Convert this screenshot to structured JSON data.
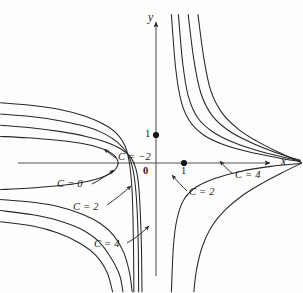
{
  "figure": {
    "background_color": "#fdfdfc",
    "ink_color": "#262626"
  },
  "axes": {
    "x_label": "x",
    "y_label": "y",
    "origin_label": "0",
    "x_tick_label": "1",
    "y_tick_label": "1",
    "x_axis_y_pixel": 163,
    "y_axis_x_pixel": 156,
    "unit_pixels": 28
  },
  "contour_labels": [
    {
      "id": "c-neg2",
      "text": "C = −2"
    },
    {
      "id": "c-0-left",
      "text": "C = 0"
    },
    {
      "id": "c-2-left",
      "text": "C = 2"
    },
    {
      "id": "c-4-left",
      "text": "C = 4"
    },
    {
      "id": "c-2-right",
      "text": "C = 2"
    },
    {
      "id": "c-4-right",
      "text": "C = 4"
    }
  ],
  "chart_data": {
    "type": "line",
    "xlabel": "x",
    "ylabel": "y",
    "grid": false,
    "legend": "inline-annotations",
    "xlim": [
      -5.6,
      5.2
    ],
    "ylim": [
      -4.6,
      5.4
    ],
    "marked_points": [
      {
        "x": 0,
        "y": 1,
        "label": "1",
        "style": "filled-dot"
      },
      {
        "x": 1,
        "y": 0,
        "label": "1",
        "style": "filled-dot"
      },
      {
        "x": 0,
        "y": 0,
        "label": "0",
        "style": "origin"
      }
    ],
    "levels": [
      -2,
      0,
      2,
      4
    ],
    "series": [
      {
        "name": "C = -2",
        "level": -2,
        "branches": [
          {
            "name": "left-loop-upper",
            "points": [
              [
                -5.55,
                0.95
              ],
              [
                -4.6,
                0.9
              ],
              [
                -3.6,
                0.82
              ],
              [
                -2.8,
                0.72
              ],
              [
                -2.2,
                0.6
              ],
              [
                -1.75,
                0.44
              ],
              [
                -1.5,
                0.28
              ],
              [
                -1.38,
                0.12
              ],
              [
                -1.35,
                0.0
              ]
            ]
          },
          {
            "name": "left-loop-lower",
            "points": [
              [
                -1.35,
                0.0
              ],
              [
                -1.38,
                -0.12
              ],
              [
                -1.5,
                -0.28
              ],
              [
                -1.75,
                -0.44
              ],
              [
                -2.2,
                -0.6
              ],
              [
                -2.8,
                -0.72
              ],
              [
                -3.6,
                -0.82
              ],
              [
                -4.6,
                -0.9
              ],
              [
                -5.55,
                -0.95
              ]
            ]
          },
          {
            "name": "right-upper",
            "points": [
              [
                0.55,
                5.3
              ],
              [
                0.7,
                3.4
              ],
              [
                0.9,
                2.2
              ],
              [
                1.2,
                1.5
              ],
              [
                1.7,
                1.0
              ],
              [
                2.4,
                0.66
              ],
              [
                3.3,
                0.4
              ],
              [
                4.3,
                0.2
              ],
              [
                5.15,
                0.05
              ]
            ]
          },
          {
            "name": "right-lower",
            "points": [
              [
                0.55,
                -4.6
              ],
              [
                0.62,
                -3.0
              ],
              [
                0.75,
                -2.0
              ],
              [
                1.0,
                -1.3
              ],
              [
                1.45,
                -0.85
              ],
              [
                2.1,
                -0.55
              ],
              [
                3.0,
                -0.3
              ],
              [
                4.1,
                -0.12
              ],
              [
                5.15,
                -0.02
              ]
            ]
          }
        ]
      },
      {
        "name": "C = 0",
        "level": 0,
        "branches": [
          {
            "name": "left-upper",
            "points": [
              [
                -5.55,
                1.35
              ],
              [
                -4.4,
                1.25
              ],
              [
                -3.4,
                1.12
              ],
              [
                -2.5,
                0.95
              ],
              [
                -1.8,
                0.75
              ],
              [
                -1.25,
                0.5
              ],
              [
                -0.9,
                0.2
              ],
              [
                -0.72,
                -0.2
              ],
              [
                -0.62,
                -0.8
              ],
              [
                -0.56,
                -1.8
              ],
              [
                -0.52,
                -3.0
              ],
              [
                -0.5,
                -4.6
              ]
            ]
          },
          {
            "name": "left-lower",
            "points": [
              [
                -5.55,
                -1.3
              ],
              [
                -4.4,
                -1.4
              ],
              [
                -3.5,
                -1.55
              ],
              [
                -2.7,
                -1.8
              ],
              [
                -2.0,
                -2.15
              ],
              [
                -1.5,
                -2.6
              ],
              [
                -1.15,
                -3.2
              ],
              [
                -0.95,
                -3.9
              ],
              [
                -0.85,
                -4.6
              ]
            ]
          },
          {
            "name": "right",
            "points": [
              [
                0.8,
                5.3
              ],
              [
                0.95,
                3.6
              ],
              [
                1.15,
                2.4
              ],
              [
                1.5,
                1.6
              ],
              [
                2.05,
                1.1
              ],
              [
                2.8,
                0.72
              ],
              [
                3.7,
                0.42
              ],
              [
                4.6,
                0.2
              ],
              [
                5.15,
                0.08
              ]
            ]
          }
        ]
      },
      {
        "name": "C = 2",
        "level": 2,
        "branches": [
          {
            "name": "left-upper",
            "points": [
              [
                -5.55,
                1.75
              ],
              [
                -4.4,
                1.65
              ],
              [
                -3.4,
                1.5
              ],
              [
                -2.5,
                1.3
              ],
              [
                -1.85,
                1.05
              ],
              [
                -1.35,
                0.72
              ],
              [
                -1.0,
                0.3
              ],
              [
                -0.82,
                -0.25
              ],
              [
                -0.72,
                -1.0
              ],
              [
                -0.66,
                -2.0
              ],
              [
                -0.63,
                -3.2
              ],
              [
                -0.62,
                -4.6
              ]
            ]
          },
          {
            "name": "left-lower",
            "points": [
              [
                -5.55,
                -1.7
              ],
              [
                -4.4,
                -1.85
              ],
              [
                -3.5,
                -2.05
              ],
              [
                -2.7,
                -2.35
              ],
              [
                -2.05,
                -2.8
              ],
              [
                -1.6,
                -3.4
              ],
              [
                -1.3,
                -4.0
              ],
              [
                -1.18,
                -4.6
              ]
            ]
          },
          {
            "name": "right",
            "points": [
              [
                1.15,
                5.3
              ],
              [
                1.35,
                3.7
              ],
              [
                1.6,
                2.5
              ],
              [
                2.0,
                1.7
              ],
              [
                2.6,
                1.15
              ],
              [
                3.35,
                0.75
              ],
              [
                4.15,
                0.42
              ],
              [
                4.8,
                0.2
              ],
              [
                5.15,
                0.1
              ]
            ]
          }
        ]
      },
      {
        "name": "C = 4",
        "level": 4,
        "branches": [
          {
            "name": "left-upper",
            "points": [
              [
                -5.55,
                2.15
              ],
              [
                -4.4,
                2.05
              ],
              [
                -3.4,
                1.9
              ],
              [
                -2.55,
                1.68
              ],
              [
                -1.9,
                1.4
              ],
              [
                -1.4,
                1.05
              ],
              [
                -1.1,
                0.6
              ],
              [
                -0.95,
                0.0
              ],
              [
                -0.86,
                -0.9
              ],
              [
                -0.82,
                -2.0
              ],
              [
                -0.8,
                -3.3
              ],
              [
                -0.79,
                -4.6
              ]
            ]
          },
          {
            "name": "left-lower",
            "points": [
              [
                -5.55,
                -2.1
              ],
              [
                -4.4,
                -2.25
              ],
              [
                -3.5,
                -2.5
              ],
              [
                -2.75,
                -2.85
              ],
              [
                -2.15,
                -3.3
              ],
              [
                -1.75,
                -3.9
              ],
              [
                -1.55,
                -4.6
              ]
            ]
          },
          {
            "name": "right-upper",
            "points": [
              [
                1.5,
                5.3
              ],
              [
                1.7,
                3.8
              ],
              [
                1.95,
                2.6
              ],
              [
                2.35,
                1.8
              ],
              [
                2.95,
                1.2
              ],
              [
                3.6,
                0.78
              ],
              [
                4.3,
                0.42
              ],
              [
                4.9,
                0.15
              ],
              [
                5.2,
                0.0
              ]
            ]
          },
          {
            "name": "right-lower",
            "points": [
              [
                5.2,
                0.0
              ],
              [
                4.5,
                -0.35
              ],
              [
                3.8,
                -0.72
              ],
              [
                3.1,
                -1.15
              ],
              [
                2.5,
                -1.65
              ],
              [
                2.0,
                -2.25
              ],
              [
                1.65,
                -3.0
              ],
              [
                1.45,
                -3.8
              ],
              [
                1.35,
                -4.6
              ]
            ]
          }
        ]
      }
    ]
  },
  "annotations": [
    {
      "id": "c-neg2",
      "text": "C = −2",
      "x": 118,
      "y": 159
    },
    {
      "id": "c-0-left",
      "text": "C = 0",
      "x": 57,
      "y": 186
    },
    {
      "id": "c-2-left",
      "text": "C = 2",
      "x": 73,
      "y": 209
    },
    {
      "id": "c-4-left",
      "text": "C = 4",
      "x": 94,
      "y": 246
    },
    {
      "id": "c-2-right",
      "text": "C = 2",
      "x": 189,
      "y": 194
    },
    {
      "id": "c-4-right",
      "text": "C = 4",
      "x": 235,
      "y": 177
    }
  ]
}
